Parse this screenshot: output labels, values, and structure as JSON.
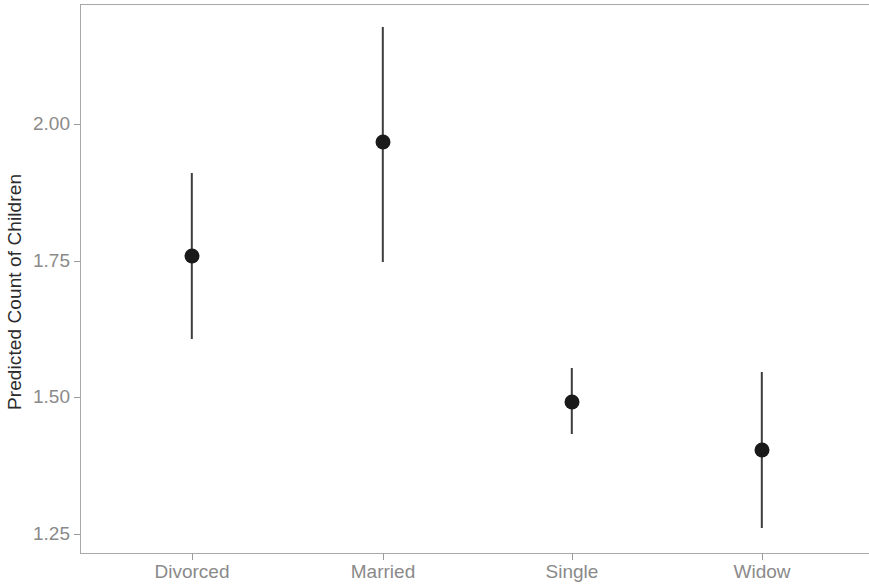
{
  "chart_data": {
    "type": "scatter",
    "title": "",
    "subtitle": "",
    "xlabel": "",
    "ylabel": "Predicted Count of Children",
    "categories": [
      "Divorced",
      "Married",
      "Single",
      "Widow"
    ],
    "values": [
      1.758,
      1.967,
      1.491,
      1.403
    ],
    "error_low": [
      1.606,
      1.747,
      1.432,
      1.26
    ],
    "error_high": [
      1.91,
      2.178,
      1.553,
      1.546
    ],
    "series": [
      {
        "name": "Predicted Count of Children",
        "points": [
          {
            "category": "Divorced",
            "estimate": 1.758,
            "lower": 1.606,
            "upper": 1.91
          },
          {
            "category": "Married",
            "estimate": 1.967,
            "lower": 1.747,
            "upper": 2.178
          },
          {
            "category": "Single",
            "estimate": 1.491,
            "lower": 1.432,
            "upper": 1.553
          },
          {
            "category": "Widow",
            "estimate": 1.403,
            "lower": 1.26,
            "upper": 1.546
          }
        ]
      }
    ],
    "ylim": [
      1.17,
      2.22
    ],
    "yticks": [
      1.25,
      1.5,
      1.75,
      2.0
    ],
    "ytick_labels": [
      "1.25",
      "1.50",
      "1.75",
      "2.00"
    ],
    "xtick_labels": [
      "Divorced",
      "Married",
      "Single",
      "Widow"
    ],
    "grid": false,
    "legend": "none",
    "colors": {
      "point": "#1a1a1a",
      "errorbar": "#3d3d3d",
      "axis": "#a8a8a8",
      "tick_text": "#8a8a8a",
      "axis_title": "#2b2b2b",
      "background": "#ffffff"
    }
  },
  "axis": {
    "y_title": "Predicted Count of Children",
    "y_ticks": [
      {
        "label": "2.00",
        "value": 2.0
      },
      {
        "label": "1.75",
        "value": 1.75
      },
      {
        "label": "1.50",
        "value": 1.5
      },
      {
        "label": "1.25",
        "value": 1.25
      }
    ],
    "x_ticks": [
      {
        "label": "Divorced"
      },
      {
        "label": "Married"
      },
      {
        "label": "Single"
      },
      {
        "label": "Widow"
      }
    ]
  }
}
